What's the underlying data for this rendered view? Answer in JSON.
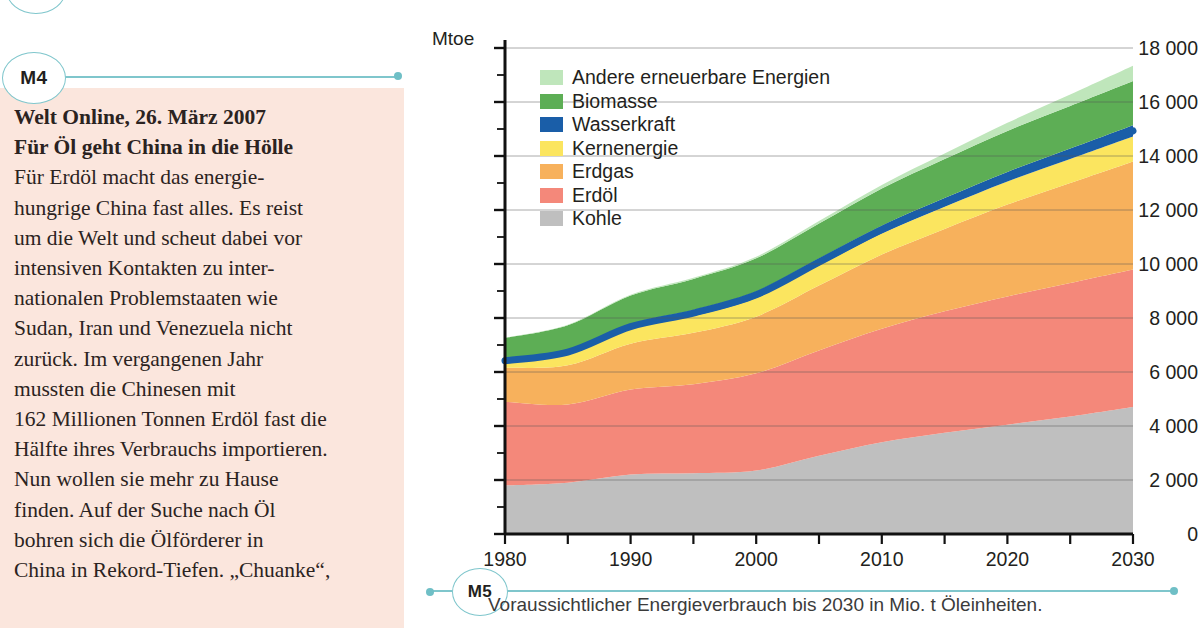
{
  "markers": {
    "article_marker": "M4",
    "chart_marker": "M5"
  },
  "article": {
    "source_line": "Welt Online, 26. März 2007",
    "headline": "Für Öl geht China in die Hölle",
    "body": "Für Erdöl macht das energie-hungrige China fast alles. Es reist um die Welt und scheut dabei vor intensiven Kontakten zu inter-nationalen Problemstaaten wie Sudan, Iran und Venezuela nicht zurück. Im vergangenen Jahr mussten die Chinesen mit 162 Millionen Tonnen Erdöl fast die Hälfte ihres Verbrauchs importieren. Nun wollen sie mehr zu Hause finden. Auf der Suche nach Öl bohren sich die Ölförderer in China in Rekord-Tiefen. „Chuanke“,",
    "lines": [
      "Für Erdöl macht das energie-",
      "hungrige China fast alles. Es reist",
      "um die Welt und scheut dabei vor",
      "intensiven Kontakten zu inter-",
      "nationalen Problemstaaten wie",
      "Sudan, Iran und Venezuela nicht",
      "zurück. Im vergangenen Jahr",
      "mussten die Chinesen mit",
      "162 Millionen Tonnen Erdöl fast die",
      "Hälfte ihres Verbrauchs importieren.",
      "Nun wollen sie mehr zu Hause",
      "finden. Auf der Suche nach Öl",
      "bohren sich die Ölförderer in",
      "China in Rekord-Tiefen. „Chuanke“,"
    ],
    "background_color": "#fbe6dd"
  },
  "caption": {
    "text": "Voraussichtlicher Energieverbrauch bis 2030 in Mio. t Öleinheiten."
  },
  "chart_data": {
    "type": "area",
    "title": "",
    "subtitle": "",
    "xlabel": "",
    "ylabel": "Mtoe",
    "unit_label": "Mtoe",
    "xlim": [
      1980,
      2030
    ],
    "ylim": [
      0,
      18000
    ],
    "y_ticks": [
      0,
      2000,
      4000,
      6000,
      8000,
      10000,
      12000,
      14000,
      16000,
      18000
    ],
    "y_tick_labels": [
      "0",
      "2000",
      "4000",
      "6000",
      "8000",
      "10000",
      "12000",
      "14000",
      "16000",
      "18000"
    ],
    "y_minor_step": 1000,
    "x_ticks": [
      1980,
      1985,
      1990,
      1995,
      2000,
      2005,
      2010,
      2015,
      2020,
      2025,
      2030
    ],
    "x_tick_labels": [
      "1980",
      "",
      "1990",
      "",
      "2000",
      "",
      "2010",
      "",
      "2020",
      "",
      "2030"
    ],
    "x_labeled": [
      1980,
      1990,
      2000,
      2010,
      2020,
      2030
    ],
    "grid": "horizontal",
    "legend_position": "upper-left-inside",
    "stacked": true,
    "stack_order_bottom_to_top": [
      "Kohle",
      "Erdöl",
      "Erdgas",
      "Kernenergie",
      "Wasserkraft",
      "Biomasse",
      "Andere erneuerbare Energien"
    ],
    "x": [
      1980,
      1985,
      1990,
      1995,
      2000,
      2005,
      2010,
      2015,
      2020,
      2025,
      2030
    ],
    "series": [
      {
        "name": "Kohle",
        "color": "#bfbfbf",
        "values": [
          1800,
          1900,
          2200,
          2250,
          2350,
          2900,
          3400,
          3750,
          4050,
          4350,
          4700
        ]
      },
      {
        "name": "Erdöl",
        "color": "#f4887a",
        "values": [
          3100,
          2900,
          3150,
          3300,
          3600,
          3900,
          4200,
          4500,
          4750,
          4950,
          5100
        ]
      },
      {
        "name": "Erdgas",
        "color": "#f7b15c",
        "values": [
          1250,
          1450,
          1700,
          1900,
          2100,
          2400,
          2750,
          3050,
          3400,
          3700,
          4000
        ]
      },
      {
        "name": "Kernenergie",
        "color": "#fbe55f",
        "values": [
          190,
          400,
          530,
          620,
          690,
          740,
          780,
          820,
          860,
          890,
          920
        ]
      },
      {
        "name": "Wasserkraft",
        "color": "#1a5ea8",
        "values": [
          150,
          180,
          200,
          225,
          240,
          260,
          290,
          320,
          350,
          385,
          420
        ]
      },
      {
        "name": "Biomasse",
        "color": "#5dae55",
        "values": [
          770,
          900,
          1050,
          1150,
          1230,
          1300,
          1380,
          1450,
          1520,
          1580,
          1640
        ]
      },
      {
        "name": "Andere erneuerbare Energien",
        "color": "#bfe6bb",
        "values": [
          10,
          20,
          30,
          45,
          60,
          90,
          130,
          200,
          300,
          420,
          560
        ]
      }
    ],
    "total_values": [
      7270,
      7750,
      8860,
      9490,
      10270,
      11590,
      12930,
      14090,
      15230,
      16275,
      17340
    ],
    "legend_entries": [
      {
        "label": "Andere erneuerbare Energien",
        "color": "#bfe6bb"
      },
      {
        "label": "Biomasse",
        "color": "#5dae55"
      },
      {
        "label": "Wasserkraft",
        "color": "#1a5ea8"
      },
      {
        "label": "Kernenergie",
        "color": "#fbe55f"
      },
      {
        "label": "Erdgas",
        "color": "#f7b15c"
      },
      {
        "label": "Erdöl",
        "color": "#f4887a"
      },
      {
        "label": "Kohle",
        "color": "#bfbfbf"
      }
    ]
  }
}
